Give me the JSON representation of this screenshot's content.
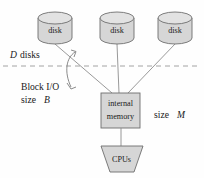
{
  "figure": {
    "background": "#ffffff",
    "shape_fill": "#d6d6d6",
    "shape_top_fill": "#e2e2e2",
    "stroke": "#6e6e6e",
    "line_color": "#8d8d8d",
    "dash_color": "#9a9a9a"
  },
  "disks": [
    {
      "label": "disk",
      "name": "disk-left"
    },
    {
      "label": "disk",
      "name": "disk-middle"
    },
    {
      "label": "disk",
      "name": "disk-right"
    }
  ],
  "memory": {
    "line1": "internal",
    "line2": "memory"
  },
  "cpus": {
    "label": "CPUs"
  },
  "annotations": {
    "disks_count": {
      "symbol": "D",
      "text": "disks"
    },
    "block_io": {
      "line1": "Block I/O",
      "line2_text": "size",
      "line2_symbol": "B"
    },
    "memory_size": {
      "text": "size",
      "symbol": "M"
    }
  }
}
